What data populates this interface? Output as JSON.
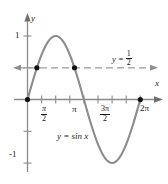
{
  "chart_data": {
    "type": "line",
    "title": "",
    "subtitle": "",
    "xlabel": "x",
    "ylabel": "y",
    "xlim": [
      -0.55,
      7.0
    ],
    "ylim": [
      -1.45,
      1.35
    ],
    "grid": false,
    "legend_position": "inline-annotation",
    "series": [
      {
        "name": "y = sin x",
        "label": "y = sin x",
        "type": "line",
        "color": "#8c8c8c",
        "x": [
          0,
          0.3927,
          0.7854,
          1.1781,
          1.5708,
          1.9635,
          2.3562,
          2.7489,
          3.1416,
          3.5343,
          3.927,
          4.3197,
          4.7124,
          5.1051,
          5.4978,
          5.8905,
          6.2832
        ],
        "y": [
          0,
          0.3827,
          0.7071,
          0.9239,
          1,
          0.9239,
          0.7071,
          0.3827,
          0,
          -0.3827,
          -0.7071,
          -0.9239,
          -1,
          -0.9239,
          -0.7071,
          -0.3827,
          0
        ]
      },
      {
        "name": "y = 1/2",
        "label": "y = 1/2",
        "type": "horizontal-line",
        "style": "dashed",
        "color": "#8c8c8c",
        "value": 0.5
      }
    ],
    "points": [
      {
        "name": "origin",
        "x": 0,
        "y": 0
      },
      {
        "name": "intersection-left",
        "x": 0.5236,
        "y": 0.5
      },
      {
        "name": "intersection-right",
        "x": 2.618,
        "y": 0.5
      },
      {
        "name": "two-pi",
        "x": 6.2832,
        "y": 0
      }
    ],
    "x_ticks": [
      {
        "value": 0.7854,
        "label": ""
      },
      {
        "value": 1.5708,
        "label": "π/2"
      },
      {
        "value": 2.3562,
        "label": ""
      },
      {
        "value": 3.1416,
        "label": "π"
      },
      {
        "value": 3.927,
        "label": ""
      },
      {
        "value": 4.7124,
        "label": "3π/2"
      },
      {
        "value": 5.4978,
        "label": ""
      },
      {
        "value": 6.2832,
        "label": "2π"
      }
    ],
    "y_ticks": [
      {
        "value": 1,
        "label": "1"
      },
      {
        "value": 0.5,
        "label": ""
      },
      {
        "value": -0.5,
        "label": ""
      },
      {
        "value": -1,
        "label": "-1"
      }
    ]
  },
  "axes": {
    "x_name": "x",
    "y_name": "y"
  },
  "tick_labels": {
    "y_one": "1",
    "y_negative_one": "-1",
    "x_pi_over_2_num": "π",
    "x_pi_over_2_den": "2",
    "x_pi": "π",
    "x_3pi_over_2_num": "3π",
    "x_3pi_over_2_den": "2",
    "x_2pi": "2π"
  },
  "annotations": {
    "curve_label": "y = sin x",
    "halfline_prefix": "y =",
    "halfline_num": "1",
    "halfline_den": "2"
  },
  "colors": {
    "curve": "#8c8c8c",
    "dashed_line": "#8c8c8c",
    "axis": "#777777",
    "text": "#1a1a1a",
    "point": "#111111",
    "background": "#ffffff"
  }
}
